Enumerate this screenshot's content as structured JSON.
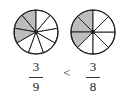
{
  "colors": {
    "shaded": "#bdbdbd",
    "unshaded": "#ffffff",
    "stroke": "#222222"
  },
  "circles": [
    {
      "name": "left",
      "parts": 9,
      "shaded": 3
    },
    {
      "name": "right",
      "parts": 8,
      "shaded": 3
    }
  ],
  "fractions": [
    {
      "numerator": "3",
      "denominator": "9"
    },
    {
      "numerator": "3",
      "denominator": "8"
    }
  ],
  "comparison": "<"
}
